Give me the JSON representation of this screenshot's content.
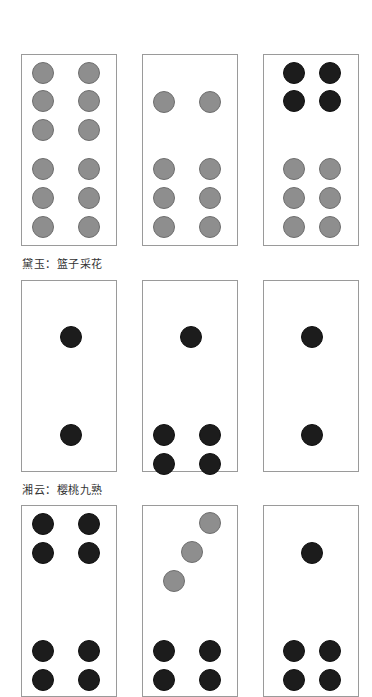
{
  "colors": {
    "gray_dot": "#8e8e8e",
    "dark_dot": "#1c1c1c",
    "card_border": "#9a9a9a"
  },
  "rows": [
    {
      "top": 54,
      "height": 192,
      "caption": "黛玉：篮子采花",
      "caption_top": 255,
      "cards": [
        {
          "left": 21,
          "dots": [
            {
              "x": 21,
              "y": 18,
              "c": "gray"
            },
            {
              "x": 67,
              "y": 18,
              "c": "gray"
            },
            {
              "x": 21,
              "y": 46,
              "c": "gray"
            },
            {
              "x": 67,
              "y": 46,
              "c": "gray"
            },
            {
              "x": 21,
              "y": 75,
              "c": "gray"
            },
            {
              "x": 67,
              "y": 75,
              "c": "gray"
            },
            {
              "x": 21,
              "y": 114,
              "c": "gray"
            },
            {
              "x": 67,
              "y": 114,
              "c": "gray"
            },
            {
              "x": 21,
              "y": 143,
              "c": "gray"
            },
            {
              "x": 67,
              "y": 143,
              "c": "gray"
            },
            {
              "x": 21,
              "y": 172,
              "c": "gray"
            },
            {
              "x": 67,
              "y": 172,
              "c": "gray"
            }
          ]
        },
        {
          "left": 142,
          "dots": [
            {
              "x": 21,
              "y": 47,
              "c": "gray"
            },
            {
              "x": 67,
              "y": 47,
              "c": "gray"
            },
            {
              "x": 21,
              "y": 114,
              "c": "gray"
            },
            {
              "x": 67,
              "y": 114,
              "c": "gray"
            },
            {
              "x": 21,
              "y": 143,
              "c": "gray"
            },
            {
              "x": 67,
              "y": 143,
              "c": "gray"
            },
            {
              "x": 21,
              "y": 172,
              "c": "gray"
            },
            {
              "x": 67,
              "y": 172,
              "c": "gray"
            }
          ]
        },
        {
          "left": 263,
          "dots": [
            {
              "x": 30,
              "y": 18,
              "c": "dark"
            },
            {
              "x": 66,
              "y": 18,
              "c": "dark"
            },
            {
              "x": 30,
              "y": 46,
              "c": "dark"
            },
            {
              "x": 66,
              "y": 46,
              "c": "dark"
            },
            {
              "x": 30,
              "y": 114,
              "c": "gray"
            },
            {
              "x": 66,
              "y": 114,
              "c": "gray"
            },
            {
              "x": 30,
              "y": 143,
              "c": "gray"
            },
            {
              "x": 66,
              "y": 143,
              "c": "gray"
            },
            {
              "x": 30,
              "y": 172,
              "c": "gray"
            },
            {
              "x": 66,
              "y": 172,
              "c": "gray"
            }
          ]
        }
      ]
    },
    {
      "top": 280,
      "height": 192,
      "caption": "湘云：樱桃九熟",
      "caption_top": 481,
      "cards": [
        {
          "left": 21,
          "dots": [
            {
              "x": 49,
              "y": 56,
              "c": "dark"
            },
            {
              "x": 49,
              "y": 154,
              "c": "dark"
            }
          ]
        },
        {
          "left": 142,
          "dots": [
            {
              "x": 48,
              "y": 56,
              "c": "dark"
            },
            {
              "x": 21,
              "y": 154,
              "c": "dark"
            },
            {
              "x": 67,
              "y": 154,
              "c": "dark"
            },
            {
              "x": 21,
              "y": 183,
              "c": "dark"
            },
            {
              "x": 67,
              "y": 183,
              "c": "dark"
            }
          ]
        },
        {
          "left": 263,
          "dots": [
            {
              "x": 48,
              "y": 56,
              "c": "dark"
            },
            {
              "x": 48,
              "y": 154,
              "c": "dark"
            }
          ]
        }
      ]
    },
    {
      "top": 505,
      "height": 192,
      "caption": "",
      "caption_top": 0,
      "cards": [
        {
          "left": 21,
          "dots": [
            {
              "x": 21,
              "y": 18,
              "c": "dark"
            },
            {
              "x": 67,
              "y": 18,
              "c": "dark"
            },
            {
              "x": 21,
              "y": 47,
              "c": "dark"
            },
            {
              "x": 67,
              "y": 47,
              "c": "dark"
            },
            {
              "x": 21,
              "y": 145,
              "c": "dark"
            },
            {
              "x": 67,
              "y": 145,
              "c": "dark"
            },
            {
              "x": 21,
              "y": 174,
              "c": "dark"
            },
            {
              "x": 67,
              "y": 174,
              "c": "dark"
            }
          ]
        },
        {
          "left": 142,
          "dots": [
            {
              "x": 67,
              "y": 17,
              "c": "gray"
            },
            {
              "x": 49,
              "y": 46,
              "c": "gray"
            },
            {
              "x": 31,
              "y": 75,
              "c": "gray"
            },
            {
              "x": 21,
              "y": 145,
              "c": "dark"
            },
            {
              "x": 67,
              "y": 145,
              "c": "dark"
            },
            {
              "x": 21,
              "y": 174,
              "c": "dark"
            },
            {
              "x": 67,
              "y": 174,
              "c": "dark"
            }
          ]
        },
        {
          "left": 263,
          "dots": [
            {
              "x": 48,
              "y": 47,
              "c": "dark"
            },
            {
              "x": 30,
              "y": 145,
              "c": "dark"
            },
            {
              "x": 66,
              "y": 145,
              "c": "dark"
            },
            {
              "x": 30,
              "y": 174,
              "c": "dark"
            },
            {
              "x": 66,
              "y": 174,
              "c": "dark"
            }
          ]
        }
      ]
    }
  ]
}
